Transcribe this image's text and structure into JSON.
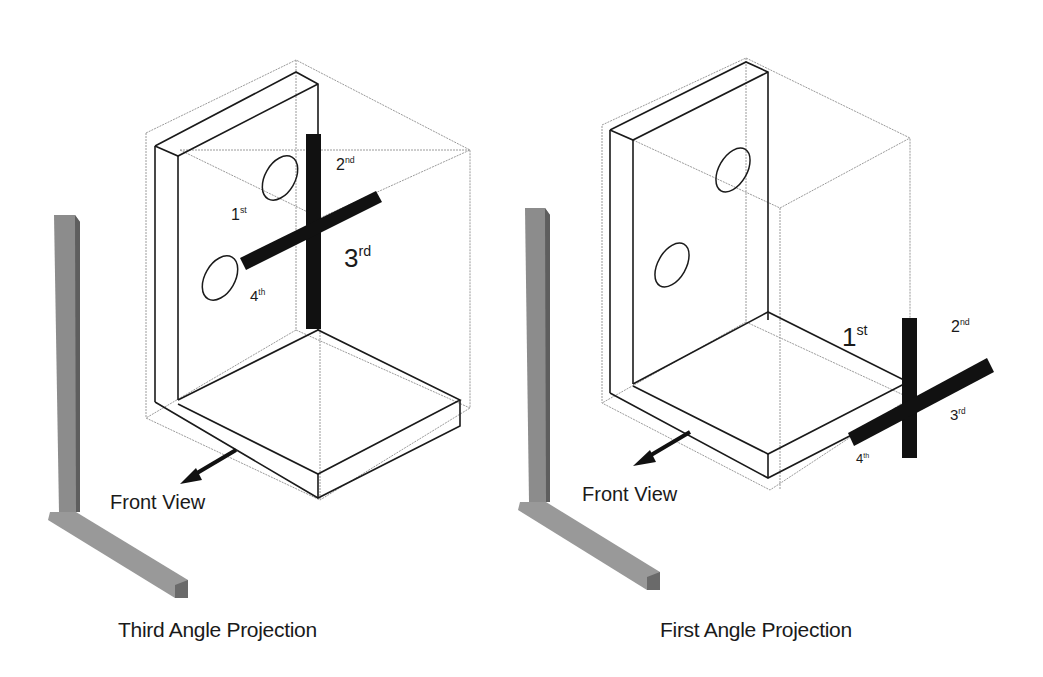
{
  "figures": [
    {
      "id": "third-angle",
      "caption": "Third Angle Projection",
      "front_view_label": "Front View",
      "quadrant_labels": [
        {
          "num": "1",
          "sup": "st"
        },
        {
          "num": "2",
          "sup": "nd"
        },
        {
          "num": "3",
          "sup": "rd"
        },
        {
          "num": "4",
          "sup": "th"
        }
      ]
    },
    {
      "id": "first-angle",
      "caption": "First Angle Projection",
      "front_view_label": "Front View",
      "quadrant_labels": [
        {
          "num": "1",
          "sup": "st"
        },
        {
          "num": "2",
          "sup": "nd"
        },
        {
          "num": "3",
          "sup": "rd"
        },
        {
          "num": "4",
          "sup": "th"
        }
      ]
    }
  ],
  "colors": {
    "background": "#ffffff",
    "line": "#1a1a1a",
    "hidden_line": "#9a9a9a",
    "axis_bar": "#111111",
    "reference_bar": "#8c8c8c"
  }
}
